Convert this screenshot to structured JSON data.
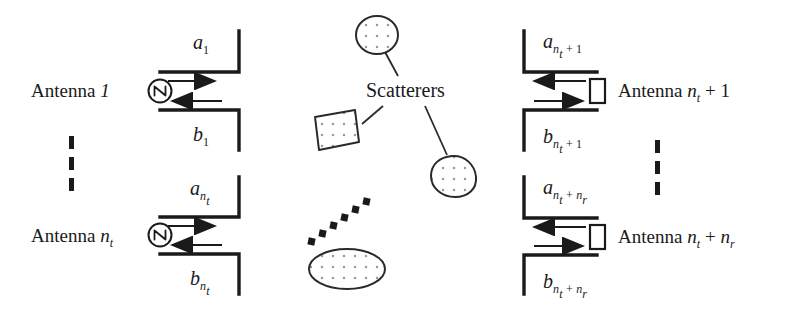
{
  "figure": {
    "background": "#ffffff",
    "stroke": "#1a1a1a",
    "dot_fill": "#888888"
  },
  "scatterers": {
    "label": "Scatterers"
  },
  "transmit_antennas": [
    {
      "name_prefix": "Antenna ",
      "name_sub": "1",
      "name_plain": "Antenna 1",
      "incident_var": "a",
      "incident_sub": "1",
      "reflected_var": "b",
      "reflected_sub": "1",
      "source_symbol": "ac-source"
    },
    {
      "name_prefix": "Antenna ",
      "name_sub": "n",
      "name_sub_sub": "t",
      "name_plain": "Antenna n_t",
      "incident_var": "a",
      "incident_sub": "n",
      "incident_sub_sub": "t",
      "reflected_var": "b",
      "reflected_sub": "n",
      "reflected_sub_sub": "t",
      "source_symbol": "ac-source"
    }
  ],
  "receive_antennas": [
    {
      "name_plain": "Antenna n_t + 1",
      "name_prefix": "Antenna ",
      "name_base": "n",
      "name_base_sub": "t",
      "name_suffix": " + 1",
      "incident_var": "a",
      "incident_sub_base": "n",
      "incident_sub_sub": "t",
      "incident_sub_suffix": " + 1",
      "reflected_var": "b",
      "reflected_sub_base": "n",
      "reflected_sub_sub": "t",
      "reflected_sub_suffix": " + 1",
      "load_symbol": "resistor-load"
    },
    {
      "name_plain": "Antenna n_t + n_r",
      "name_prefix": "Antenna ",
      "name_base": "n",
      "name_base_sub": "t",
      "name_suffix": " + ",
      "name_base2": "n",
      "name_base2_sub": "r",
      "incident_var": "a",
      "incident_sub_base": "n",
      "incident_sub_sub": "t",
      "incident_sub_suffix": " + ",
      "incident_sub_base2": "n",
      "incident_sub_sub2": "r",
      "reflected_var": "b",
      "reflected_sub_base": "n",
      "reflected_sub_sub": "t",
      "reflected_sub_suffix": " + ",
      "reflected_sub_base2": "n",
      "reflected_sub_sub2": "r",
      "load_symbol": "resistor-load"
    }
  ],
  "ellipsis": {
    "left_label": "vertical-dots",
    "right_label": "vertical-dots",
    "center_label": "diagonal-dots"
  }
}
